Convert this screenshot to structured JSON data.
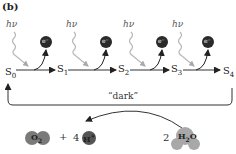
{
  "panel_label": "(b)",
  "photon_label": "hν",
  "electron_label": "e⁻",
  "states": [
    {
      "name": "S",
      "sub": "0"
    },
    {
      "name": "S",
      "sub": "1"
    },
    {
      "name": "S",
      "sub": "2"
    },
    {
      "name": "S",
      "sub": "3"
    },
    {
      "name": "S",
      "sub": "4"
    }
  ],
  "dark_label": "“dark”",
  "products": {
    "o2": {
      "base": "O",
      "sub": "2"
    },
    "plus": "+",
    "proton_coeff": "4",
    "proton": {
      "base": "H",
      "sup": "+"
    }
  },
  "reactants": {
    "water_coeff": "2",
    "water": {
      "h": "H",
      "sub": "2",
      "o": "O"
    }
  },
  "colors": {
    "electron": "#2a2a2a",
    "photon_wave": "#b8b8b8",
    "o2_fill": "#7a7a7a",
    "proton_fill": "#555555",
    "water_fill": "#a8a8a8",
    "line": "#333333"
  }
}
